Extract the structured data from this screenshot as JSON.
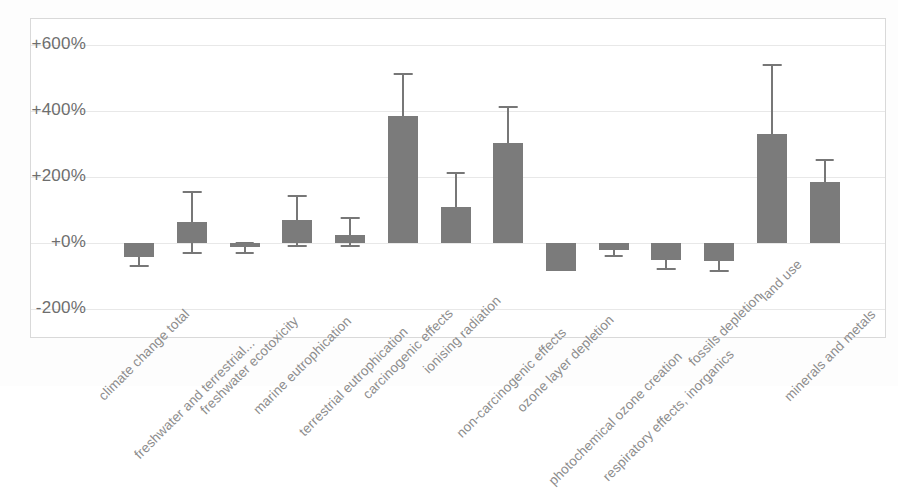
{
  "chart_data": {
    "type": "bar",
    "title": "",
    "subtitle": "",
    "xlabel": "",
    "ylabel": "",
    "ylim": [
      -200,
      600
    ],
    "ytick_labels": [
      "+600%",
      "+400%",
      "+200%",
      "+0%",
      "-200%"
    ],
    "ytick_values": [
      600,
      400,
      200,
      0,
      -200
    ],
    "grid": true,
    "legend": "none",
    "value_unit": "%",
    "error_bars": "asymmetric whiskers",
    "categories": [
      "climate change total",
      "freshwater and terrestrial...",
      "freshwater ecotoxicity",
      "marine eutrophication",
      "terrestrial eutrophication",
      "carcinogenic effects",
      "ionising radiation",
      "non-carcinogenic effects",
      "ozone layer depletion",
      "photochemical ozone creation",
      "respiratory effects, inorganics",
      "fossils depletion",
      "land use",
      "minerals and metals"
    ],
    "values": [
      -40,
      65,
      -10,
      70,
      25,
      385,
      110,
      305,
      -85,
      -20,
      -50,
      -55,
      330,
      185
    ],
    "error_low": [
      -65,
      -25,
      -25,
      -5,
      -5,
      385,
      110,
      305,
      -85,
      -35,
      -75,
      -80,
      330,
      135
    ],
    "error_high": [
      -15,
      160,
      5,
      145,
      80,
      515,
      215,
      415,
      -85,
      -10,
      -35,
      -40,
      545,
      255
    ],
    "bar_color": "#7b7b7b",
    "whisker_color": "#777777",
    "gridline_color": "#e8e8e8",
    "axis_label_color": "#6e6e6e",
    "tick_label_color": "#8c8c8c",
    "background_color": "#ffffff"
  }
}
